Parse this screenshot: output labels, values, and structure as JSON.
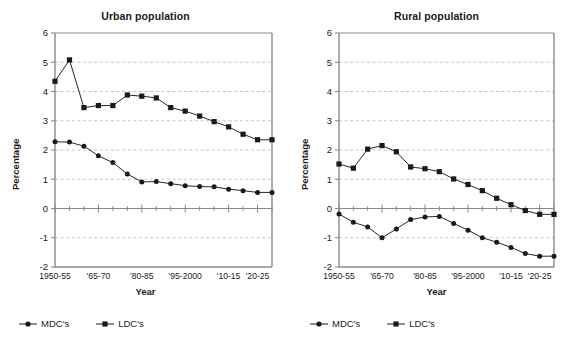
{
  "figure": {
    "background": "#ffffff",
    "line_color": "#1a1a1a",
    "grid_color": "#c8a0a0",
    "axis_color": "#808080"
  },
  "panels": [
    {
      "id": "urban",
      "title": "Urban population",
      "xlabel": "Year",
      "ylabel": "Percentage",
      "legend": [
        {
          "name": "MDC's",
          "marker": "circle"
        },
        {
          "name": "LDC's",
          "marker": "square"
        }
      ]
    },
    {
      "id": "rural",
      "title": "Rural population",
      "xlabel": "Year",
      "ylabel": "Percentage",
      "legend": [
        {
          "name": "MDC's",
          "marker": "circle"
        },
        {
          "name": "LDC's",
          "marker": "square"
        }
      ]
    }
  ],
  "chart_data": [
    {
      "type": "line",
      "title": "Urban population",
      "xlabel": "Year",
      "ylabel": "Percentage",
      "ylim": [
        -2,
        6
      ],
      "yticks": [
        -2,
        -1,
        0,
        1,
        2,
        3,
        4,
        5,
        6
      ],
      "grid": true,
      "legend_position": "bottom-left",
      "categories": [
        "1950-55",
        "'55-60",
        "'60-65",
        "'65-70",
        "'70-75",
        "'75-80",
        "'80-85",
        "'85-90",
        "'90-95",
        "'95-2000",
        "'2000-05",
        "'05-10",
        "'10-15",
        "'15-20",
        "'20-25",
        "'25-30"
      ],
      "xtick_labels": [
        "1950-55",
        "'65-70",
        "'80-85",
        "'95-2000",
        "'10-15",
        "'20-25"
      ],
      "xtick_indices": [
        0,
        3,
        6,
        9,
        12,
        14
      ],
      "series": [
        {
          "name": "MDC's",
          "marker": "circle",
          "values": [
            2.28,
            2.27,
            2.13,
            1.8,
            1.57,
            1.18,
            0.91,
            0.92,
            0.85,
            0.78,
            0.75,
            0.74,
            0.66,
            0.61,
            0.55,
            0.55
          ]
        },
        {
          "name": "LDC's",
          "marker": "square",
          "values": [
            4.35,
            5.08,
            3.45,
            3.52,
            3.52,
            3.88,
            3.84,
            3.78,
            3.45,
            3.33,
            3.16,
            2.97,
            2.79,
            2.54,
            2.35,
            2.35
          ]
        }
      ]
    },
    {
      "type": "line",
      "title": "Rural population",
      "xlabel": "Year",
      "ylabel": "Percentage",
      "ylim": [
        -2,
        6
      ],
      "yticks": [
        -2,
        -1,
        0,
        1,
        2,
        3,
        4,
        5,
        6
      ],
      "grid": true,
      "legend_position": "bottom-left",
      "categories": [
        "1950-55",
        "'55-60",
        "'60-65",
        "'65-70",
        "'70-75",
        "'75-80",
        "'80-85",
        "'85-90",
        "'90-95",
        "'95-2000",
        "'2000-05",
        "'05-10",
        "'10-15",
        "'15-20",
        "'20-25",
        "'25-30"
      ],
      "xtick_labels": [
        "1950-55",
        "'65-70",
        "'80-85",
        "'95-2000",
        "'10-15",
        "'20-25"
      ],
      "xtick_indices": [
        0,
        3,
        6,
        9,
        12,
        14
      ],
      "series": [
        {
          "name": "MDC's",
          "marker": "circle",
          "values": [
            -0.19,
            -0.47,
            -0.63,
            -1.0,
            -0.7,
            -0.38,
            -0.29,
            -0.27,
            -0.51,
            -0.74,
            -1.0,
            -1.15,
            -1.33,
            -1.54,
            -1.63,
            -1.63
          ]
        },
        {
          "name": "LDC's",
          "marker": "square",
          "values": [
            1.52,
            1.38,
            2.03,
            2.15,
            1.94,
            1.42,
            1.36,
            1.26,
            1.01,
            0.82,
            0.61,
            0.35,
            0.13,
            -0.07,
            -0.2,
            -0.2
          ]
        }
      ]
    }
  ]
}
